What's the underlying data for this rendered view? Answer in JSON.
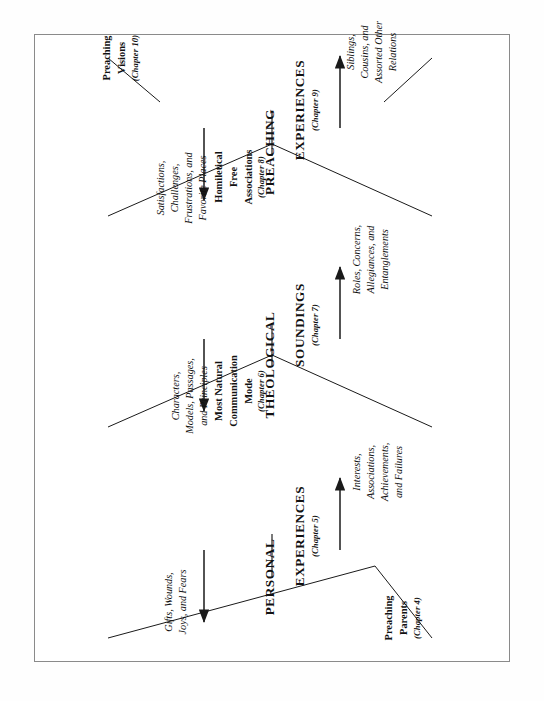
{
  "figure": {
    "orientation": "rotated-90",
    "title": "",
    "line_color": "#1a1a1a",
    "frame_color": "#8a8a8a"
  },
  "levels": [
    {
      "id": "personal",
      "word1": "PERSONAL",
      "word2": "EXPERIENCES",
      "chapter": "(Chapter 5)",
      "left_label": "Gifts, Wounds,\nJoys, and Fears",
      "right_label": "Interests,\nAssociations,\nAchievements,\nand Failures"
    },
    {
      "id": "theological",
      "word1": "THEOLOGICAL",
      "word2": "SOUNDINGS",
      "chapter": "(Chapter 7)",
      "left_label": "Characters,\nModels, Passages,\nand Principles",
      "right_label": "Roles, Concerns,\nAllegiances, and\nEntanglements"
    },
    {
      "id": "preaching",
      "word1": "PREACHING",
      "word2": "EXPERIENCES",
      "chapter": "(Chapter 9)",
      "left_label": "Satisfactions,\nChallenges,\nFrustrations, and\nFavorite Places",
      "right_label": "Siblings,\nCousins, and\nAssorted Other\nRelations"
    }
  ],
  "nodes": [
    {
      "id": "preaching-parents",
      "label": "Preaching\nParents",
      "chapter": "(Chapter 4)"
    },
    {
      "id": "natural-mode",
      "label": "Most Natural\nCommunication\nMode",
      "chapter": "(Chapter 6)"
    },
    {
      "id": "free-associations",
      "label": "Homiletical\nFree\nAssociations",
      "chapter": "(Chapter 8)"
    },
    {
      "id": "preaching-visions",
      "label": "Preaching\nVisions",
      "chapter": "(Chapter 10)"
    }
  ]
}
